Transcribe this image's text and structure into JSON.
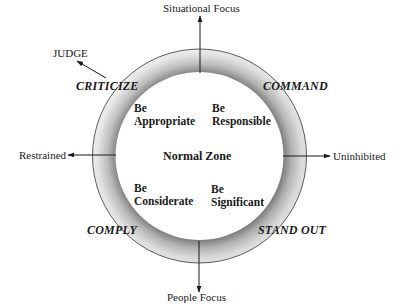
{
  "diagram": {
    "axes": {
      "top": "Situational Focus",
      "bottom": "People Focus",
      "left": "Restrained",
      "right": "Uninhibited"
    },
    "outside_label": "JUDGE",
    "ring_labels": {
      "top_left": "CRITICIZE",
      "top_right": "COMMAND",
      "bottom_left": "COMPLY",
      "bottom_right": "STAND OUT"
    },
    "center_label": "Normal Zone",
    "quadrants": {
      "top_left": {
        "line1": "Be",
        "line2": "Appropriate"
      },
      "top_right": {
        "line1": "Be",
        "line2": "Responsible"
      },
      "bottom_left": {
        "line1": "Be",
        "line2": "Considerate"
      },
      "bottom_right": {
        "line1": "Be",
        "line2": "Significant"
      }
    },
    "colors": {
      "ring_inner": "#8a8a8a",
      "ring_outer": "#f2f2f2",
      "line": "#1a1a1a"
    }
  }
}
